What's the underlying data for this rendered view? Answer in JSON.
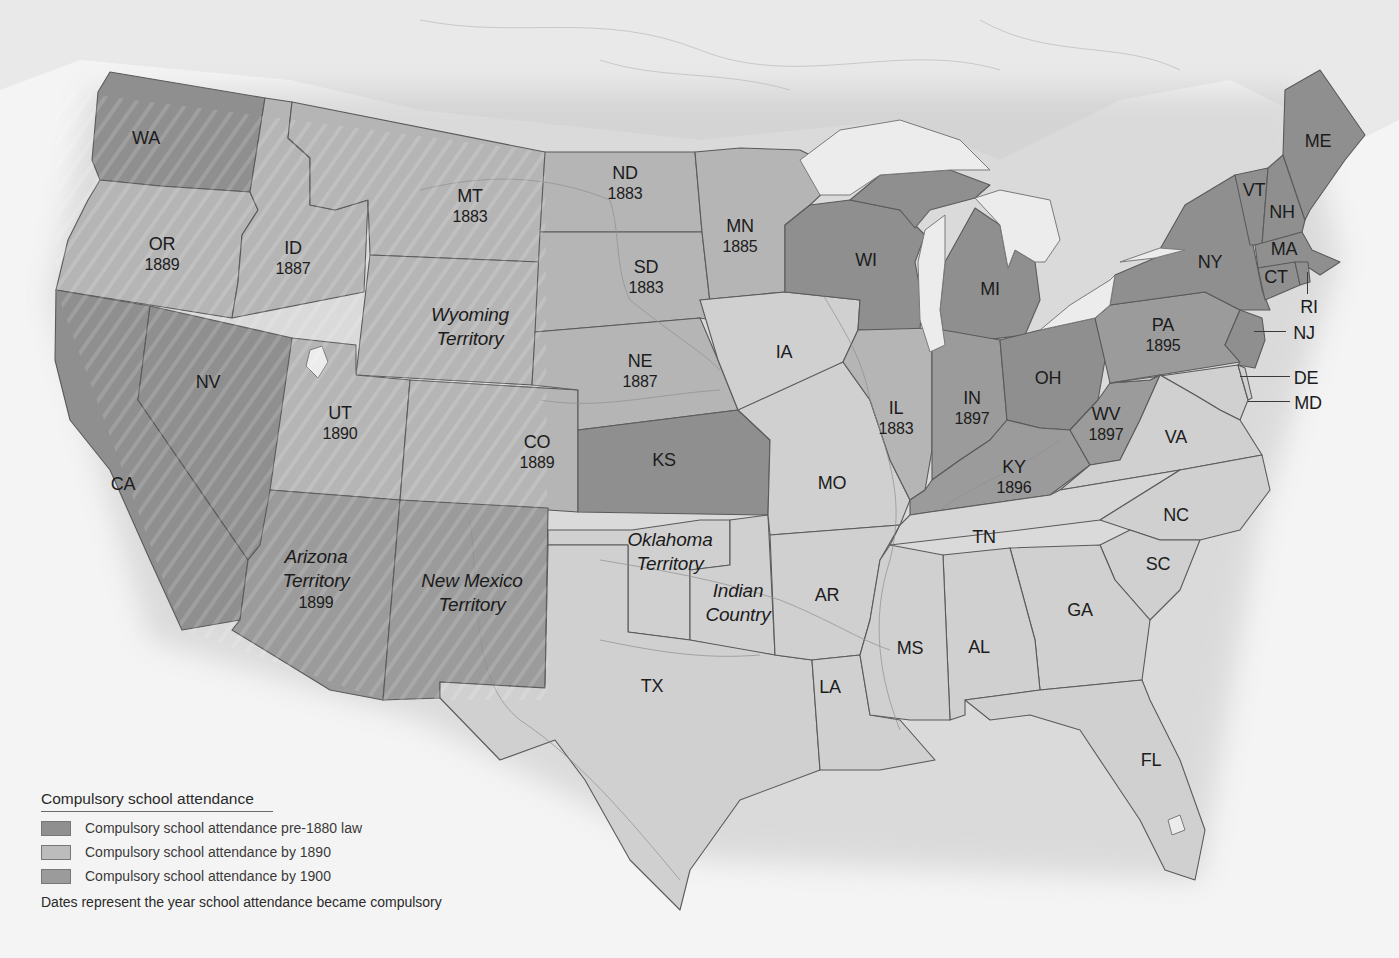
{
  "map": {
    "colors": {
      "pre1880": "#8f8f8f",
      "by1890": "#bcbcbc",
      "by1900": "#9b9b9b",
      "none": "#d2d2d2",
      "background": "#f4f4f4",
      "canada": "#e6e6e6"
    },
    "regions": [
      {
        "abbr": "WA",
        "year": "",
        "category": "pre1880"
      },
      {
        "abbr": "OR",
        "year": "1889",
        "category": "by1890"
      },
      {
        "abbr": "ID",
        "year": "1887",
        "category": "by1890"
      },
      {
        "abbr": "MT",
        "year": "1883",
        "category": "by1890"
      },
      {
        "abbr": "Wyoming Territory",
        "year": "",
        "category": "by1890"
      },
      {
        "abbr": "ND",
        "year": "1883",
        "category": "by1890"
      },
      {
        "abbr": "SD",
        "year": "1883",
        "category": "by1890"
      },
      {
        "abbr": "MN",
        "year": "1885",
        "category": "by1890"
      },
      {
        "abbr": "NE",
        "year": "1887",
        "category": "by1890"
      },
      {
        "abbr": "IA",
        "year": "",
        "category": "none"
      },
      {
        "abbr": "WI",
        "year": "",
        "category": "pre1880"
      },
      {
        "abbr": "MI",
        "year": "",
        "category": "pre1880"
      },
      {
        "abbr": "NY",
        "year": "",
        "category": "pre1880"
      },
      {
        "abbr": "VT",
        "year": "",
        "category": "pre1880"
      },
      {
        "abbr": "NH",
        "year": "",
        "category": "pre1880"
      },
      {
        "abbr": "ME",
        "year": "",
        "category": "pre1880"
      },
      {
        "abbr": "MA",
        "year": "",
        "category": "pre1880"
      },
      {
        "abbr": "CT",
        "year": "",
        "category": "pre1880"
      },
      {
        "abbr": "RI",
        "year": "",
        "category": "pre1880"
      },
      {
        "abbr": "NJ",
        "year": "",
        "category": "pre1880"
      },
      {
        "abbr": "PA",
        "year": "1895",
        "category": "by1900"
      },
      {
        "abbr": "DE",
        "year": "",
        "category": "none"
      },
      {
        "abbr": "MD",
        "year": "",
        "category": "none"
      },
      {
        "abbr": "NV",
        "year": "",
        "category": "pre1880"
      },
      {
        "abbr": "CA",
        "year": "",
        "category": "pre1880"
      },
      {
        "abbr": "UT",
        "year": "1890",
        "category": "by1890"
      },
      {
        "abbr": "CO",
        "year": "1889",
        "category": "by1890"
      },
      {
        "abbr": "KS",
        "year": "",
        "category": "pre1880"
      },
      {
        "abbr": "IL",
        "year": "1883",
        "category": "by1890"
      },
      {
        "abbr": "IN",
        "year": "1897",
        "category": "by1900"
      },
      {
        "abbr": "OH",
        "year": "",
        "category": "pre1880"
      },
      {
        "abbr": "WV",
        "year": "1897",
        "category": "by1900"
      },
      {
        "abbr": "VA",
        "year": "",
        "category": "none"
      },
      {
        "abbr": "KY",
        "year": "1896",
        "category": "by1900"
      },
      {
        "abbr": "MO",
        "year": "",
        "category": "none"
      },
      {
        "abbr": "TN",
        "year": "",
        "category": "none"
      },
      {
        "abbr": "NC",
        "year": "",
        "category": "none"
      },
      {
        "abbr": "SC",
        "year": "",
        "category": "none"
      },
      {
        "abbr": "GA",
        "year": "",
        "category": "none"
      },
      {
        "abbr": "AL",
        "year": "",
        "category": "none"
      },
      {
        "abbr": "MS",
        "year": "",
        "category": "none"
      },
      {
        "abbr": "AR",
        "year": "",
        "category": "none"
      },
      {
        "abbr": "LA",
        "year": "",
        "category": "none"
      },
      {
        "abbr": "FL",
        "year": "",
        "category": "none"
      },
      {
        "abbr": "TX",
        "year": "",
        "category": "none"
      },
      {
        "abbr": "Oklahoma Territory",
        "year": "",
        "category": "none"
      },
      {
        "abbr": "Indian Country",
        "year": "",
        "category": "none"
      },
      {
        "abbr": "Arizona Territory",
        "year": "1899",
        "category": "by1900"
      },
      {
        "abbr": "New Mexico Territory",
        "year": "",
        "category": "by1900"
      }
    ],
    "labels": {
      "WA": {
        "name": "WA"
      },
      "OR": {
        "name": "OR",
        "year": "1889"
      },
      "ID": {
        "name": "ID",
        "year": "1887"
      },
      "MT": {
        "name": "MT",
        "year": "1883"
      },
      "WY": {
        "name1": "Wyoming",
        "name2": "Territory"
      },
      "ND": {
        "name": "ND",
        "year": "1883"
      },
      "SD": {
        "name": "SD",
        "year": "1883"
      },
      "MN": {
        "name": "MN",
        "year": "1885"
      },
      "NE": {
        "name": "NE",
        "year": "1887"
      },
      "IA": {
        "name": "IA"
      },
      "WI": {
        "name": "WI"
      },
      "MI": {
        "name": "MI"
      },
      "NY": {
        "name": "NY"
      },
      "VT": {
        "name": "VT"
      },
      "NH": {
        "name": "NH"
      },
      "ME": {
        "name": "ME"
      },
      "MA": {
        "name": "MA"
      },
      "CT": {
        "name": "CT"
      },
      "RI": {
        "name": "RI"
      },
      "NJ": {
        "name": "NJ"
      },
      "PA": {
        "name": "PA",
        "year": "1895"
      },
      "DE": {
        "name": "DE"
      },
      "MD": {
        "name": "MD"
      },
      "NV": {
        "name": "NV"
      },
      "CA": {
        "name": "CA"
      },
      "UT": {
        "name": "UT",
        "year": "1890"
      },
      "CO": {
        "name": "CO",
        "year": "1889"
      },
      "KS": {
        "name": "KS"
      },
      "IL": {
        "name": "IL",
        "year": "1883"
      },
      "IN": {
        "name": "IN",
        "year": "1897"
      },
      "OH": {
        "name": "OH"
      },
      "WV": {
        "name": "WV",
        "year": "1897"
      },
      "VA": {
        "name": "VA"
      },
      "KY": {
        "name": "KY",
        "year": "1896"
      },
      "MO": {
        "name": "MO"
      },
      "TN": {
        "name": "TN"
      },
      "NC": {
        "name": "NC"
      },
      "SC": {
        "name": "SC"
      },
      "GA": {
        "name": "GA"
      },
      "AL": {
        "name": "AL"
      },
      "MS": {
        "name": "MS"
      },
      "AR": {
        "name": "AR"
      },
      "LA": {
        "name": "LA"
      },
      "FL": {
        "name": "FL"
      },
      "TX": {
        "name": "TX"
      },
      "OK": {
        "name1": "Oklahoma",
        "name2": "Territory"
      },
      "IC": {
        "name1": "Indian",
        "name2": "Country"
      },
      "AZ": {
        "name1": "Arizona",
        "name2": "Territory",
        "year": "1899"
      },
      "NM": {
        "name1": "New Mexico",
        "name2": "Territory"
      }
    }
  },
  "legend": {
    "title": "Compulsory school attendance",
    "items": [
      {
        "label": "Compulsory school attendance pre-1880 law",
        "color": "#8f8f8f"
      },
      {
        "label": "Compulsory school attendance by 1890",
        "color": "#bcbcbc"
      },
      {
        "label": "Compulsory school attendance by 1900",
        "color": "#9b9b9b"
      }
    ],
    "note": "Dates represent the year school attendance became compulsory"
  }
}
